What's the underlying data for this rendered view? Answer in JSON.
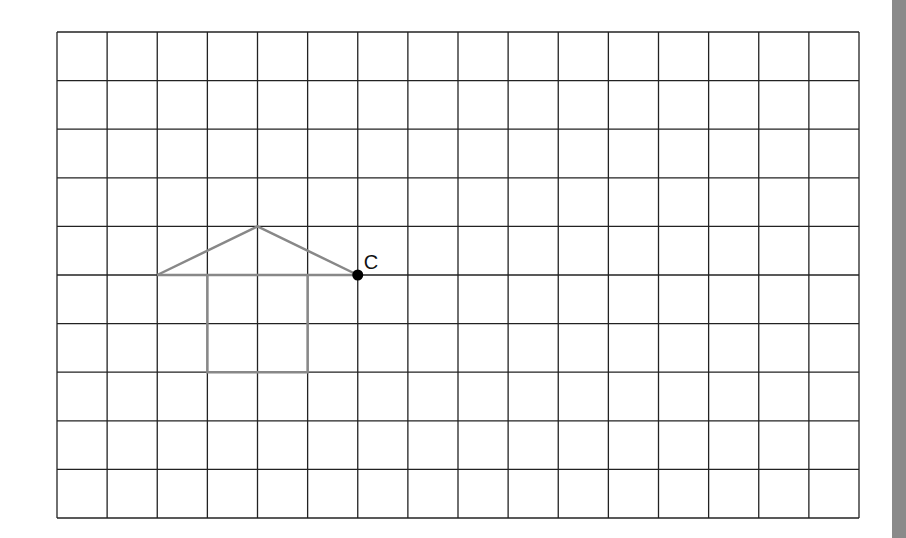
{
  "grid": {
    "columns": 16,
    "rows": 10,
    "left": 57,
    "top": 32,
    "right": 859,
    "bottom": 518,
    "line_color": "#222222"
  },
  "shape": {
    "stroke_color": "#888888",
    "roof": [
      [
        2,
        5
      ],
      [
        4,
        4
      ],
      [
        6,
        5
      ]
    ],
    "roof_base": [
      [
        2,
        5
      ],
      [
        6,
        5
      ]
    ],
    "body": [
      [
        3,
        5
      ],
      [
        3,
        7
      ],
      [
        5,
        7
      ],
      [
        5,
        5
      ]
    ]
  },
  "point": {
    "label": "C",
    "col": 6,
    "row": 5,
    "color": "#000000"
  },
  "side_bar": {
    "color": "#8a8a8a"
  }
}
